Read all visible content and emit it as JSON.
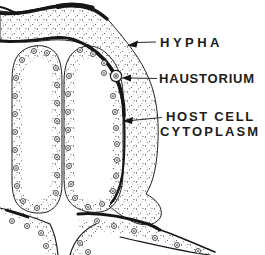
{
  "figure": {
    "type": "labeled-line-diagram",
    "labels": {
      "hypha": "HYPHA",
      "haustorium": "HAUSTORIUM",
      "host_cell_line1": "HOST CELL",
      "host_cell_line2": "CYTOPLASM"
    },
    "colors": {
      "background": "#ffffff",
      "ink": "#161616",
      "stipple": "#4a4a4a"
    }
  }
}
